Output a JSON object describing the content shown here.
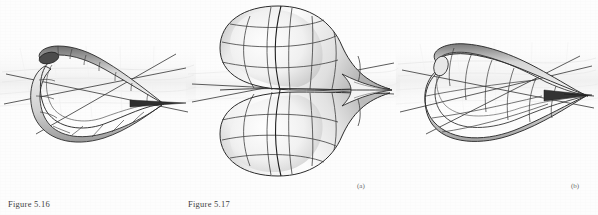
{
  "page": {
    "background_color": "#fdfdfd",
    "ink_color": "#3a3a3a",
    "kind": "scanned-book-figure-page"
  },
  "captions": {
    "figure_516": "Figure 5.16",
    "figure_517": "Figure 5.17"
  },
  "sublabels": {
    "a": "(a)",
    "b": "(b)"
  },
  "figures": [
    {
      "id": "figure-5-16",
      "caption": "Figure 5.16",
      "description": "3D shaded wireframe surface: a narrow folded lip/cusp ridge sweeping to a sharp point at the right, drawn over a faint ground plane with straight coordinate axis lines crossing through it.",
      "surface_fill_light": "#f4f4f4",
      "surface_fill_dark": "#8e8e8e",
      "line_color": "#2b2b2b",
      "axis_color": "#4a4a4a"
    },
    {
      "id": "figure-5-17-a",
      "caption": "Figure 5.17",
      "sublabel": "(a)",
      "description": "3D shaded surface of revolution resembling a cusp / swallowtail catastrophe: a large rounded bulbous lobe on the left tapering into a sharp horizontal spike at the right, mirrored above and below the horizontal plane, with meridian and parallel grid curves.",
      "surface_fill_light": "#fafafa",
      "surface_fill_dark": "#9a9a9a",
      "line_color": "#2b2b2b",
      "axis_color": "#4a4a4a"
    },
    {
      "id": "figure-5-17-b",
      "sublabel": "(b)",
      "description": "3D shaded wireframe surface: an elongated leaf / lens shaped double fold closing to a sharp cusp point at the right, drawn over a faint ground plane with straight coordinate axis lines crossing through it.",
      "surface_fill_light": "#f4f4f4",
      "surface_fill_dark": "#8e8e8e",
      "line_color": "#2b2b2b",
      "axis_color": "#4a4a4a"
    }
  ]
}
